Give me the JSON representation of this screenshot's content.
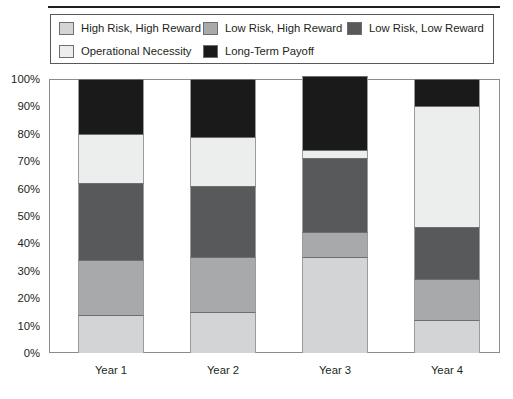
{
  "chart_data": {
    "type": "bar",
    "subtype": "stacked-bar-100-percent",
    "title": "",
    "subtitle": "",
    "xlabel": "",
    "ylabel": "",
    "categories": [
      "Year 1",
      "Year 2",
      "Year 3",
      "Year 4"
    ],
    "ylim": [
      0,
      100
    ],
    "ytick_labels": [
      "0%",
      "10%",
      "20%",
      "30%",
      "40%",
      "50%",
      "60%",
      "70%",
      "80%",
      "90%",
      "100%"
    ],
    "ytick_values": [
      0,
      10,
      20,
      30,
      40,
      50,
      60,
      70,
      80,
      90,
      100
    ],
    "grid": false,
    "legend_position": "top",
    "stack_order": "bottom-to-top",
    "series": [
      {
        "name": "High Risk, High Reward",
        "color": "#d3d4d5",
        "values": [
          14,
          15,
          35,
          12
        ]
      },
      {
        "name": "Low Risk, High Reward",
        "color": "#a8a9ab",
        "values": [
          20,
          20,
          9,
          15
        ]
      },
      {
        "name": "Low Risk, Low Reward",
        "color": "#58595b",
        "values": [
          28,
          26,
          27,
          19
        ]
      },
      {
        "name": "Operational Necessity",
        "color": "#eceded",
        "values": [
          18,
          18,
          3,
          44
        ]
      },
      {
        "name": "Long-Term Payoff",
        "color": "#1a1a1a",
        "values": [
          20,
          21,
          27,
          10
        ]
      }
    ]
  },
  "legend": {
    "entries": [
      {
        "label": "High Risk, High Reward",
        "swatch_name": "swatch-high-risk-high-reward"
      },
      {
        "label": "Low Risk, High Reward",
        "swatch_name": "swatch-low-risk-high-reward"
      },
      {
        "label": "Low Risk, Low Reward",
        "swatch_name": "swatch-low-risk-low-reward"
      },
      {
        "label": "Operational Necessity",
        "swatch_name": "swatch-operational-necessity"
      },
      {
        "label": "Long-Term Payoff",
        "swatch_name": "swatch-long-term-payoff"
      }
    ]
  },
  "colors": {
    "frame": "#8a8b8d",
    "rule": "#231f20",
    "text": "#231f20",
    "background": "#ffffff"
  }
}
